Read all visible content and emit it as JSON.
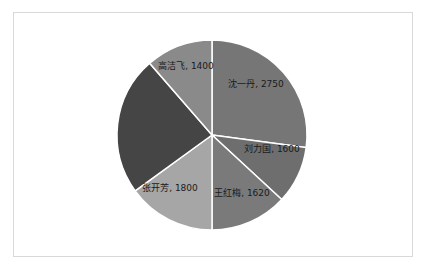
{
  "chart_data": {
    "type": "pie",
    "title": "",
    "start_angle": 0,
    "direction": "clockwise",
    "center": [
      212,
      135
    ],
    "radius": 95,
    "slices": [
      {
        "name": "沈一丹",
        "value": 2750,
        "label": "沈一丹, 2750",
        "color": "#767676",
        "angle": [
          0,
          97.6
        ],
        "label_pos": [
          256,
          87
        ]
      },
      {
        "name": "刘力国",
        "value": 1600,
        "label": "刘力国, 1600",
        "color": "#6e6e6e",
        "angle": [
          97.6,
          132.8
        ],
        "label_pos": [
          272,
          152
        ]
      },
      {
        "name": "王红梅",
        "value": 1620,
        "label": "王红梅, 1620",
        "color": "#7a7a7a",
        "angle": [
          132.8,
          180
        ],
        "label_pos": [
          242,
          196
        ]
      },
      {
        "name": "张开芳",
        "value": 1800,
        "label": "张开芳, 1800",
        "color": "#a6a6a6",
        "angle": [
          180,
          234
        ],
        "label_pos": [
          170,
          191
        ]
      },
      {
        "name": "",
        "value": null,
        "label": "",
        "color": "#454545",
        "angle": [
          234,
          319
        ],
        "label_pos": [
          150,
          130
        ]
      },
      {
        "name": "高洁飞",
        "value": 1400,
        "label": "高洁飞, 1400",
        "color": "#8a8a8a",
        "angle": [
          319,
          360
        ],
        "label_pos": [
          186,
          69
        ]
      }
    ]
  }
}
